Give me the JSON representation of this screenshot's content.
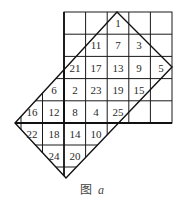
{
  "caption": {
    "label": "图",
    "letter": "a"
  },
  "colors": {
    "line": "#1a1a1a",
    "text": "#2a2a2a",
    "background": "#ffffff"
  },
  "grid": {
    "upper_square": {
      "x0": 64,
      "y0": 12,
      "x1": 172,
      "y1": 123,
      "columns": 5,
      "rows": 5
    },
    "lower_left_extension": {
      "columns_x": [
        21,
        43,
        64
      ],
      "rows_y": [
        79,
        101,
        123,
        145,
        167
      ]
    },
    "diamond": {
      "top": [
        117,
        12
      ],
      "right": [
        172,
        67
      ],
      "bottom": [
        66,
        178
      ],
      "left": [
        15,
        123
      ]
    }
  },
  "numbers": [
    {
      "value": "1",
      "x": 118,
      "y": 23
    },
    {
      "value": "11",
      "x": 96,
      "y": 45
    },
    {
      "value": "7",
      "x": 118,
      "y": 45
    },
    {
      "value": "3",
      "x": 139,
      "y": 45
    },
    {
      "value": "21",
      "x": 75,
      "y": 68
    },
    {
      "value": "17",
      "x": 96,
      "y": 68
    },
    {
      "value": "13",
      "x": 118,
      "y": 68
    },
    {
      "value": "9",
      "x": 139,
      "y": 68
    },
    {
      "value": "5",
      "x": 161,
      "y": 68
    },
    {
      "value": "6",
      "x": 54,
      "y": 90
    },
    {
      "value": "2",
      "x": 75,
      "y": 90
    },
    {
      "value": "23",
      "x": 96,
      "y": 90
    },
    {
      "value": "19",
      "x": 118,
      "y": 90
    },
    {
      "value": "15",
      "x": 139,
      "y": 90
    },
    {
      "value": "16",
      "x": 32,
      "y": 112
    },
    {
      "value": "12",
      "x": 54,
      "y": 112
    },
    {
      "value": "8",
      "x": 75,
      "y": 112
    },
    {
      "value": "4",
      "x": 96,
      "y": 112
    },
    {
      "value": "25",
      "x": 118,
      "y": 112
    },
    {
      "value": "22",
      "x": 32,
      "y": 134
    },
    {
      "value": "18",
      "x": 54,
      "y": 134
    },
    {
      "value": "14",
      "x": 75,
      "y": 134
    },
    {
      "value": "10",
      "x": 96,
      "y": 134
    },
    {
      "value": "24",
      "x": 54,
      "y": 156
    },
    {
      "value": "20",
      "x": 75,
      "y": 156
    }
  ]
}
